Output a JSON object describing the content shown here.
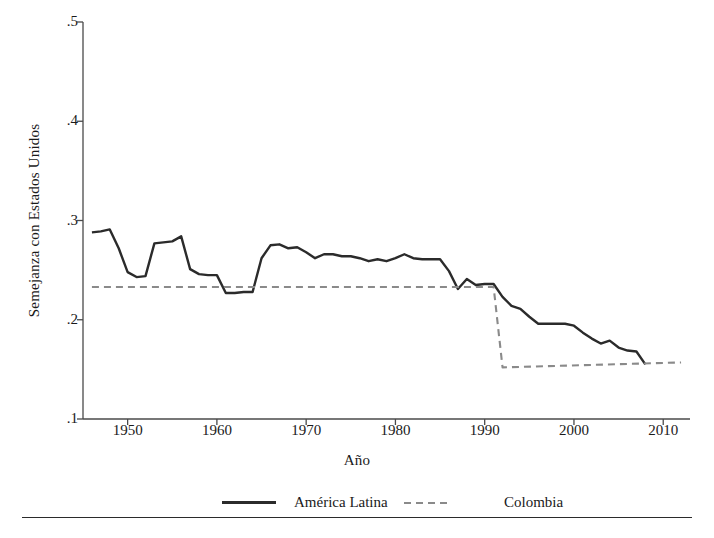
{
  "chart_data": {
    "type": "line",
    "title": "",
    "xlabel": "Año",
    "ylabel": "Semejanza con Estados Unidos",
    "xlim": [
      1945,
      2013
    ],
    "ylim": [
      0.1,
      0.5
    ],
    "xticks": [
      1950,
      1960,
      1970,
      1980,
      1990,
      2000,
      2010
    ],
    "xtick_labels": [
      "1950",
      "1960",
      "1970",
      "1980",
      "1990",
      "2000",
      "2010"
    ],
    "yticks": [
      0.1,
      0.2,
      0.3,
      0.4,
      0.5
    ],
    "ytick_labels": [
      ".1",
      ".2",
      ".3",
      ".4",
      ".5"
    ],
    "grid": false,
    "legend_position": "bottom",
    "series": [
      {
        "name": "América Latina",
        "style": "solid",
        "color": "#2b2b2b",
        "x": [
          1946,
          1947,
          1948,
          1949,
          1950,
          1951,
          1952,
          1953,
          1954,
          1955,
          1956,
          1957,
          1958,
          1959,
          1960,
          1961,
          1962,
          1963,
          1964,
          1965,
          1966,
          1967,
          1968,
          1969,
          1970,
          1971,
          1972,
          1973,
          1974,
          1975,
          1976,
          1977,
          1978,
          1979,
          1980,
          1981,
          1982,
          1983,
          1984,
          1985,
          1986,
          1987,
          1988,
          1989,
          1990,
          1991,
          1992,
          1993,
          1994,
          1995,
          1996,
          1997,
          1998,
          1999,
          2000,
          2001,
          2002,
          2003,
          2004,
          2005,
          2006,
          2007,
          2008
        ],
        "values": [
          0.288,
          0.289,
          0.291,
          0.272,
          0.248,
          0.243,
          0.244,
          0.277,
          0.278,
          0.279,
          0.284,
          0.251,
          0.246,
          0.245,
          0.245,
          0.227,
          0.227,
          0.228,
          0.228,
          0.262,
          0.275,
          0.276,
          0.272,
          0.273,
          0.268,
          0.262,
          0.266,
          0.266,
          0.264,
          0.264,
          0.262,
          0.259,
          0.261,
          0.259,
          0.262,
          0.266,
          0.262,
          0.261,
          0.261,
          0.261,
          0.249,
          0.231,
          0.241,
          0.235,
          0.236,
          0.236,
          0.223,
          0.214,
          0.211,
          0.203,
          0.196,
          0.196,
          0.196,
          0.196,
          0.194,
          0.187,
          0.181,
          0.176,
          0.179,
          0.172,
          0.169,
          0.168,
          0.155
        ]
      },
      {
        "name": "Colombia",
        "style": "dashed",
        "color": "#8a8a8a",
        "x": [
          1946,
          1990,
          1991,
          1992,
          2012
        ],
        "values": [
          0.233,
          0.233,
          0.233,
          0.152,
          0.157
        ]
      }
    ]
  },
  "axis": {
    "ylabel": "Semejanza con Estados Unidos",
    "xlabel": "Año"
  },
  "legend": {
    "items": [
      {
        "label": "América Latina",
        "swatch": "solid-line-swatch"
      },
      {
        "label": "Colombia",
        "swatch": "dashed-line-swatch"
      }
    ]
  }
}
